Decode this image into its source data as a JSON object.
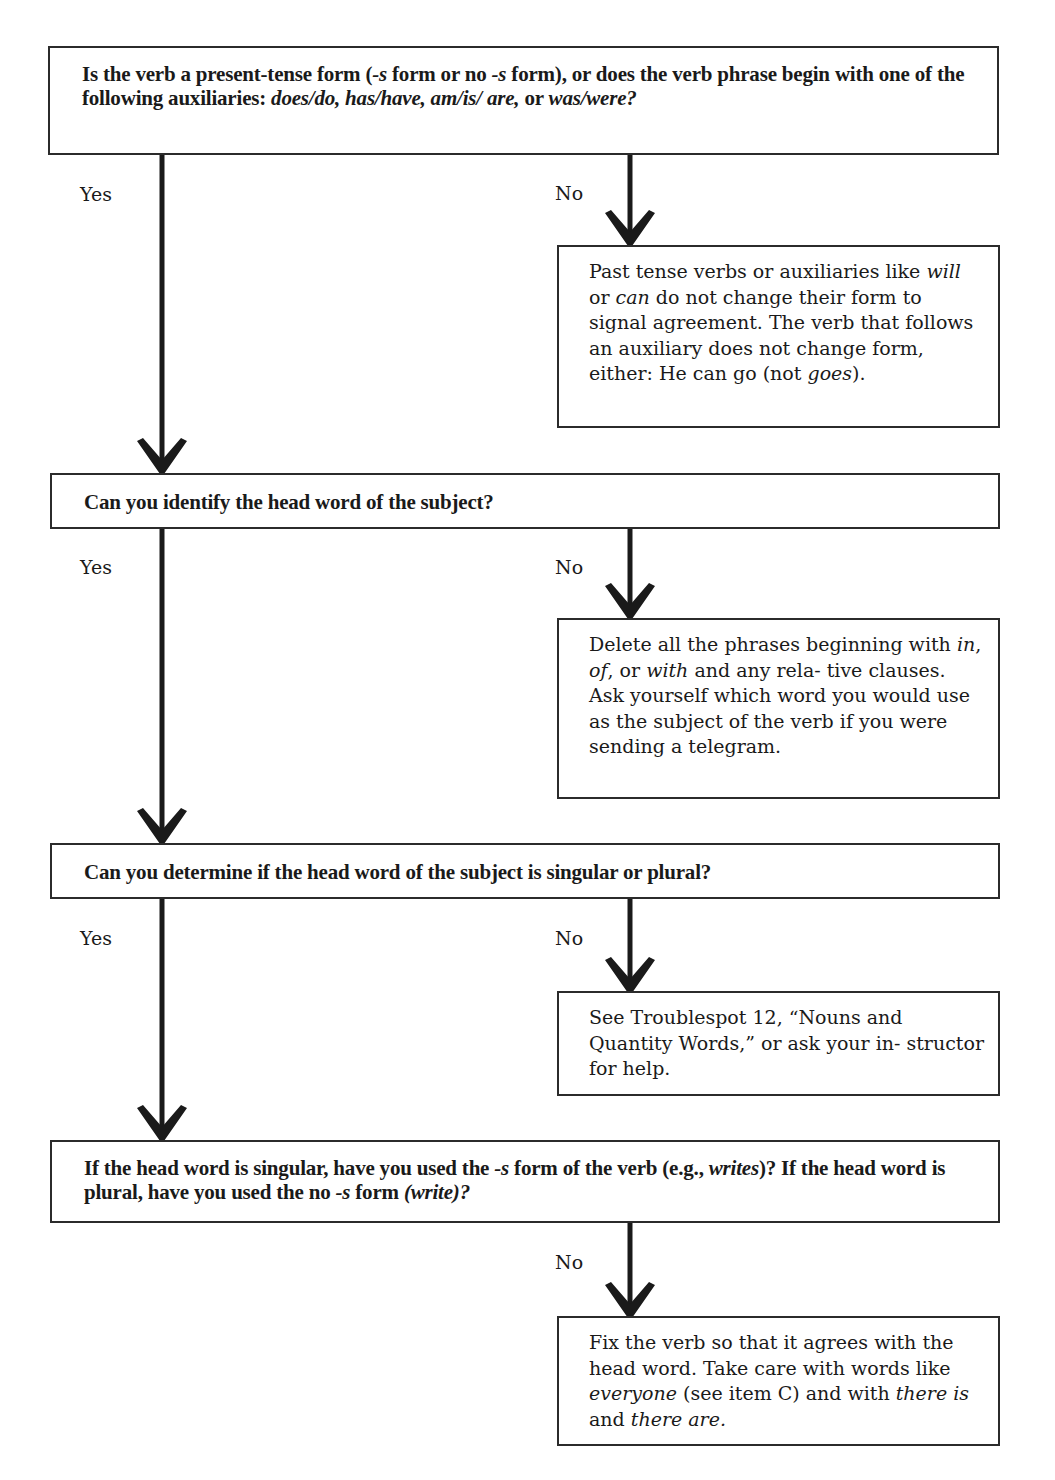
{
  "flowchart": {
    "questions": [
      {
        "id": "q1",
        "html_parts": [
          {
            "text": "Is the verb a present-tense form (",
            "italic": false
          },
          {
            "text": "-s",
            "italic": true
          },
          {
            "text": " form or no ",
            "italic": false
          },
          {
            "text": "-s",
            "italic": true
          },
          {
            "text": " form), or does the verb phrase begin with one of the following auxiliaries: ",
            "italic": false
          },
          {
            "text": "does/do, has/have, am/is/ are,",
            "italic": true
          },
          {
            "text": " or ",
            "italic": false
          },
          {
            "text": "was/were?",
            "italic": true
          }
        ],
        "yes_label": "Yes",
        "no_label": "No"
      },
      {
        "id": "q2",
        "html_parts": [
          {
            "text": "Can you identify the head word of the subject?",
            "italic": false
          }
        ],
        "yes_label": "Yes",
        "no_label": "No"
      },
      {
        "id": "q3",
        "html_parts": [
          {
            "text": "Can you determine if the head word of the subject is singular or plural?",
            "italic": false
          }
        ],
        "yes_label": "Yes",
        "no_label": "No"
      },
      {
        "id": "q4",
        "html_parts": [
          {
            "text": "If the head word is singular, have you used the ",
            "italic": false
          },
          {
            "text": "-s",
            "italic": true
          },
          {
            "text": " form of the verb (e.g., ",
            "italic": false
          },
          {
            "text": "writes",
            "italic": true
          },
          {
            "text": ")? If the head word is plural, have you used the no ",
            "italic": false
          },
          {
            "text": "-s",
            "italic": true
          },
          {
            "text": " form ",
            "italic": false
          },
          {
            "text": "(write)?",
            "italic": true
          }
        ],
        "no_label": "No"
      }
    ],
    "side_notes": [
      {
        "id": "n1",
        "html_parts": [
          {
            "text": "Past tense verbs or auxiliaries like ",
            "italic": false
          },
          {
            "text": "will",
            "italic": true
          },
          {
            "text": " or ",
            "italic": false
          },
          {
            "text": "can",
            "italic": true
          },
          {
            "text": " do not change their form to signal agreement. The verb that follows an auxiliary does not change form, either: He can go (not ",
            "italic": false
          },
          {
            "text": "goes",
            "italic": true
          },
          {
            "text": ").",
            "italic": false
          }
        ]
      },
      {
        "id": "n2",
        "html_parts": [
          {
            "text": "Delete all the phrases beginning with ",
            "italic": false
          },
          {
            "text": "in",
            "italic": true
          },
          {
            "text": ", ",
            "italic": false
          },
          {
            "text": "of",
            "italic": true
          },
          {
            "text": ", or ",
            "italic": false
          },
          {
            "text": "with",
            "italic": true
          },
          {
            "text": " and any rela- tive clauses. Ask yourself which word you would use as the subject of the verb if you were sending a telegram.",
            "italic": false
          }
        ]
      },
      {
        "id": "n3",
        "html_parts": [
          {
            "text": "See Troublespot 12, “Nouns and Quantity Words,” or ask your in- structor for help.",
            "italic": false
          }
        ]
      },
      {
        "id": "n4",
        "html_parts": [
          {
            "text": "Fix the verb so that it agrees with the head word. Take care with words like ",
            "italic": false
          },
          {
            "text": "everyone",
            "italic": true
          },
          {
            "text": " (see item C) and with ",
            "italic": false
          },
          {
            "text": "there is",
            "italic": true
          },
          {
            "text": " and ",
            "italic": false
          },
          {
            "text": "there are.",
            "italic": true
          }
        ]
      }
    ],
    "colors": {
      "line": "#1a1a1a",
      "border": "#2b2b2b",
      "background": "#ffffff"
    }
  }
}
